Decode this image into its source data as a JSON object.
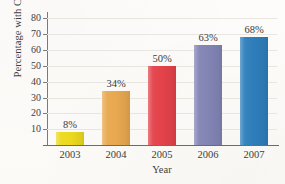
{
  "chart_data": {
    "type": "bar",
    "title": "",
    "xlabel": "Year",
    "ylabel": "Percentage with Cameras",
    "categories": [
      "2003",
      "2004",
      "2005",
      "2006",
      "2007"
    ],
    "values": [
      8,
      34,
      50,
      63,
      68
    ],
    "data_labels": [
      "8%",
      "34%",
      "50%",
      "63%",
      "68%"
    ],
    "ylim": [
      0,
      84
    ],
    "yticks": [
      10,
      20,
      30,
      40,
      50,
      60,
      70,
      80
    ],
    "ytick_labels": [
      "10",
      "20",
      "30",
      "40",
      "50",
      "60",
      "70",
      "80"
    ],
    "grid": "horizontal",
    "legend": "none",
    "bar_colors": [
      "#ecd91f",
      "#e8a84f",
      "#e4424a",
      "#8284b4",
      "#2e7ebb"
    ],
    "series": [
      {
        "name": "Percentage with Cameras",
        "points": [
          {
            "category": "2003",
            "value": 8,
            "label": "8%",
            "color": "#ecd91f"
          },
          {
            "category": "2004",
            "value": 34,
            "label": "34%",
            "color": "#e8a84f"
          },
          {
            "category": "2005",
            "value": 50,
            "label": "50%",
            "color": "#e4424a"
          },
          {
            "category": "2006",
            "value": 63,
            "label": "63%",
            "color": "#8284b4"
          },
          {
            "category": "2007",
            "value": 68,
            "label": "68%",
            "color": "#2e7ebb"
          }
        ]
      }
    ]
  }
}
